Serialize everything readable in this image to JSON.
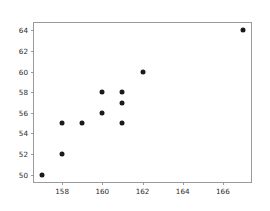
{
  "chart_data": {
    "type": "scatter",
    "title": "",
    "xlabel": "",
    "ylabel": "",
    "xlim": [
      156.6,
      167.4
    ],
    "ylim": [
      49.3,
      64.7
    ],
    "xticks": [
      158,
      160,
      162,
      164,
      166
    ],
    "yticks": [
      50,
      52,
      54,
      56,
      58,
      60,
      62,
      64
    ],
    "xtick_labels": [
      "158",
      "160",
      "162",
      "164",
      "166"
    ],
    "ytick_labels": [
      "50",
      "52",
      "54",
      "56",
      "58",
      "60",
      "62",
      "64"
    ],
    "grid": false,
    "legend": null,
    "marker": "circle",
    "marker_color": "#1a1a1a",
    "marker_size": 5,
    "series": [
      {
        "name": "points",
        "x": [
          157,
          158,
          158,
          159,
          160,
          160,
          161,
          161,
          161,
          162,
          167
        ],
        "y": [
          50,
          52,
          55,
          55,
          56,
          58,
          55,
          57,
          58,
          60,
          64
        ]
      }
    ]
  },
  "figure": {
    "background": "#ffffff",
    "axes_edge_color": "#9a9a9a",
    "tick_color": "#2b2b2b"
  }
}
